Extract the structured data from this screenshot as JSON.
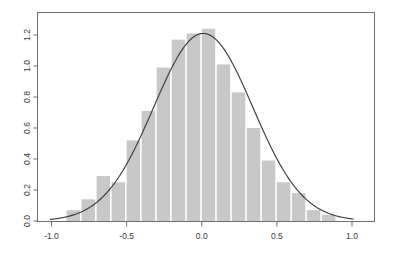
{
  "chart_data": {
    "type": "bar",
    "title": "",
    "subtitle": "",
    "xlabel": "",
    "ylabel": "",
    "xlim": [
      -1.15,
      1.15
    ],
    "ylim": [
      0.0,
      1.29
    ],
    "grid": false,
    "legend": null,
    "frame": "box",
    "bin_width": 0.1,
    "bin_edges": [
      -0.9,
      -0.8,
      -0.7,
      -0.6,
      -0.5,
      -0.4,
      -0.3,
      -0.2,
      -0.1,
      0.0,
      0.1,
      0.2,
      0.3,
      0.4,
      0.5,
      0.6,
      0.7,
      0.8,
      0.9
    ],
    "categories": [
      "-0.9 to -0.8",
      "-0.8 to -0.7",
      "-0.7 to -0.6",
      "-0.6 to -0.5",
      "-0.5 to -0.4",
      "-0.4 to -0.3",
      "-0.3 to -0.2",
      "-0.2 to -0.1",
      "-0.1 to 0.0",
      "0.0 to 0.1",
      "0.1 to 0.2",
      "0.2 to 0.3",
      "0.3 to 0.4",
      "0.4 to 0.5",
      "0.5 to 0.6",
      "0.6 to 0.7",
      "0.7 to 0.8",
      "0.8 to 0.9"
    ],
    "values": [
      0.07,
      0.14,
      0.29,
      0.25,
      0.52,
      0.71,
      0.99,
      1.17,
      1.21,
      1.24,
      1.01,
      0.83,
      0.6,
      0.39,
      0.25,
      0.18,
      0.07,
      0.04
    ],
    "bar_color": "#c8c8c8",
    "bar_edge_color": "#ffffff",
    "series": [
      {
        "name": "histogram",
        "type": "bar",
        "values": [
          0.07,
          0.14,
          0.29,
          0.25,
          0.52,
          0.71,
          0.99,
          1.17,
          1.21,
          1.24,
          1.01,
          0.83,
          0.6,
          0.39,
          0.25,
          0.18,
          0.07,
          0.04
        ]
      },
      {
        "name": "density-curve",
        "type": "line",
        "color": "#3c3c3c",
        "mean": 0.01,
        "sd": 0.33,
        "peak_y": 1.21,
        "peak_x": 0.01
      }
    ],
    "x_ticks": [
      -1.0,
      -0.5,
      0.0,
      0.5,
      1.0
    ],
    "x_tick_labels": [
      "-1.0",
      "-0.5",
      "0.0",
      "0.5",
      "1.0"
    ],
    "y_ticks": [
      0.0,
      0.2,
      0.4,
      0.6,
      0.8,
      1.0,
      1.2
    ],
    "y_tick_labels": [
      "0.0",
      "0.2",
      "0.4",
      "0.6",
      "0.8",
      "1.0",
      "1.2"
    ]
  },
  "axes": {
    "frame_color": "#6e6e6e",
    "tick_color": "#6e6e6e",
    "label_color": "#3a3a3a"
  }
}
